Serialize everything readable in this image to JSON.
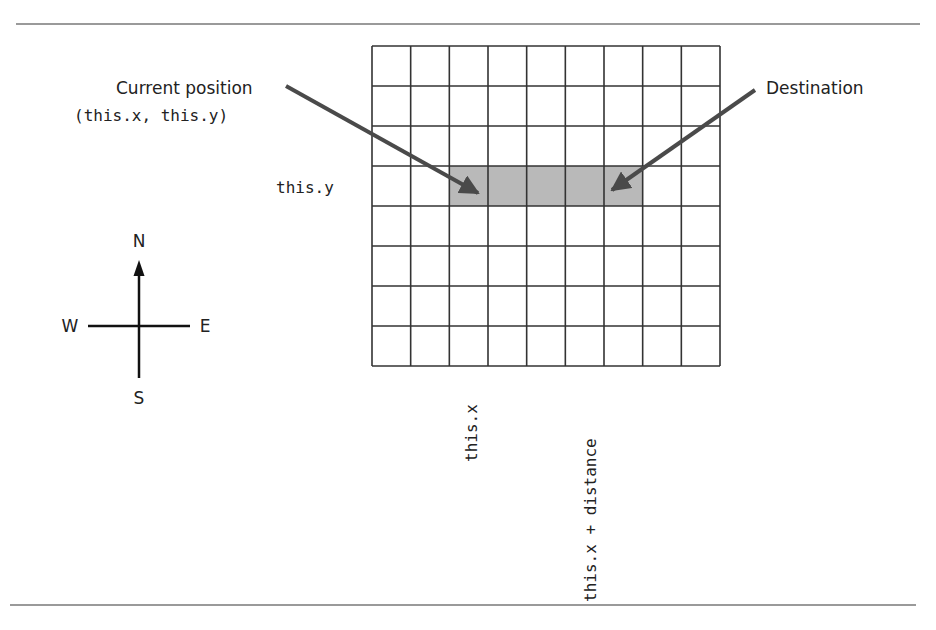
{
  "diagram": {
    "rules": {
      "color": "#9a9a9a"
    },
    "grid": {
      "columns": 9,
      "rows": 8,
      "x": 372,
      "y": 46,
      "width": 348,
      "height": 320,
      "line_color": "#333333",
      "highlight": {
        "row": 3,
        "col_start": 2,
        "col_end": 6,
        "fill": "#b9b9b9"
      }
    },
    "labels": {
      "current_position": "Current position",
      "current_coords": "(this.x, this.y)",
      "destination": "Destination",
      "this_y": "this.y",
      "this_x": "this.x",
      "this_x_plus_distance": "this.x + distance"
    },
    "arrows": {
      "color": "#4a4a4a",
      "current": {
        "from": [
          286,
          86
        ],
        "to": [
          478,
          193
        ]
      },
      "destination": {
        "from": [
          755,
          90
        ],
        "to": [
          612,
          190
        ]
      }
    },
    "compass": {
      "north": "N",
      "south": "S",
      "east": "E",
      "west": "W",
      "center": [
        139,
        326
      ]
    }
  }
}
